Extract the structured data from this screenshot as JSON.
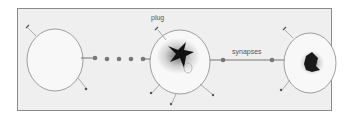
{
  "diagram": {
    "labels": {
      "plug": "plug",
      "synapses": "synapses"
    },
    "colors": {
      "background": "#efefef",
      "border": "#8a8a8a",
      "cell_fill": "#f7f7f7",
      "line": "#777777",
      "node": "#777777",
      "blob": "#111111"
    },
    "cells": [
      {
        "name": "left-cell",
        "content": "empty"
      },
      {
        "name": "middle-cell",
        "content": "dark blob"
      },
      {
        "name": "right-cell",
        "content": "dark blob"
      }
    ],
    "chain_dots": 5
  }
}
